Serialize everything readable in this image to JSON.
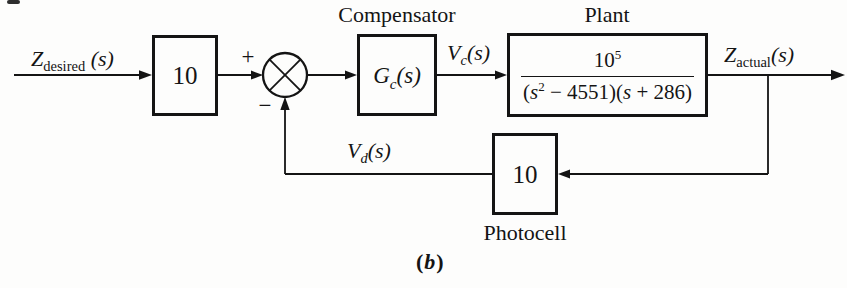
{
  "colors": {
    "ink": "#141414",
    "paper": "#fdfdfc"
  },
  "signals": {
    "input": {
      "base": "Z",
      "sub": "desired",
      "suffix": " (s)"
    },
    "vc": {
      "base": "V",
      "sub": "c",
      "suffix": "(s)"
    },
    "output": {
      "base": "Z",
      "sub": "actual",
      "suffix": "(s)"
    },
    "vd": {
      "base": "V",
      "sub": "d",
      "suffix": "(s)"
    }
  },
  "junction": {
    "plus": "+",
    "minus": "−"
  },
  "blocks": {
    "input_gain": {
      "value": "10"
    },
    "compensator": {
      "title": "Compensator",
      "base": "G",
      "sub": "c",
      "suffix": "(s)"
    },
    "plant": {
      "title": "Plant",
      "numerator": {
        "base": "10",
        "exp": "5"
      },
      "denominator": {
        "p1": "(",
        "s1": "s",
        "exp": "2",
        "mid": " − 4551)(",
        "s2": "s",
        "end": " + 286)"
      }
    },
    "photocell": {
      "value": "10",
      "title": "Photocell"
    }
  },
  "caption": {
    "open": "(",
    "letter": "b",
    "close": ")"
  }
}
